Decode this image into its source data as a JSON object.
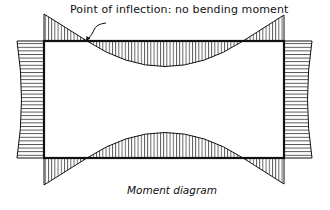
{
  "diagram": {
    "type": "moment-diagram-portal-frame",
    "annotation": "Point of inflection: no bending moment",
    "caption": "Moment diagram",
    "colors": {
      "line": "#111111",
      "hatch": "#222222",
      "background": "#ffffff"
    },
    "frame": {
      "left_x": 44,
      "right_x": 284,
      "top_y": 41,
      "bottom_y": 158
    },
    "elements": [
      {
        "name": "top-beam-diagram",
        "shape": "negative end moments with positive midspan sag, vertical hatching"
      },
      {
        "name": "bottom-beam-diagram",
        "shape": "mirror of top beam, vertical hatching"
      },
      {
        "name": "left-column-diagram",
        "shape": "concave outward, horizontal hatching"
      },
      {
        "name": "right-column-diagram",
        "shape": "concave outward, horizontal hatching"
      }
    ]
  }
}
